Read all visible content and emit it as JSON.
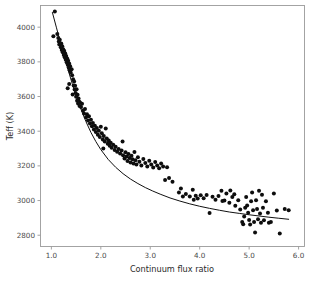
{
  "chart_data": {
    "type": "scatter",
    "title": "",
    "xlabel": "Continuum flux ratio",
    "ylabel": "Teff (K)",
    "xlim": [
      0.78,
      6.12
    ],
    "ylim": [
      2735,
      4125
    ],
    "grid": false,
    "legend": null,
    "xticks": [
      1.0,
      2.0,
      3.0,
      4.0,
      5.0,
      6.0
    ],
    "xticklabels": [
      "1.0",
      "2.0",
      "3.0",
      "4.0",
      "5.0",
      "6.0"
    ],
    "yticks": [
      2800,
      3000,
      3200,
      3400,
      3600,
      3800,
      4000
    ],
    "yticklabels": [
      "2800",
      "3000",
      "3200",
      "3400",
      "3600",
      "3800",
      "4000"
    ],
    "marker": {
      "shape": "circle",
      "color": "#0d0d0d",
      "size": 2.0
    },
    "fit_curve": {
      "name": "empirical calibration fit",
      "color": "#111111",
      "width": 1.0,
      "x": [
        1.02,
        1.1,
        1.18,
        1.26,
        1.34,
        1.42,
        1.5,
        1.6,
        1.7,
        1.8,
        1.9,
        2.0,
        2.15,
        2.3,
        2.45,
        2.6,
        2.75,
        2.9,
        3.05,
        3.2,
        3.4,
        3.6,
        3.8,
        4.0,
        4.2,
        4.4,
        4.6,
        4.8,
        5.0,
        5.2,
        5.4,
        5.6,
        5.8
      ],
      "y": [
        4085,
        4000,
        3915,
        3832,
        3752,
        3676,
        3604,
        3525,
        3455,
        3393,
        3340,
        3294,
        3237,
        3192,
        3155,
        3124,
        3098,
        3075,
        3055,
        3037,
        3015,
        2997,
        2981,
        2967,
        2955,
        2944,
        2934,
        2926,
        2918,
        2911,
        2904,
        2898,
        2892
      ]
    },
    "points": [
      [
        1.07,
        4090
      ],
      [
        1.04,
        3947
      ],
      [
        1.12,
        3960
      ],
      [
        1.14,
        3938
      ],
      [
        1.15,
        3918
      ],
      [
        1.16,
        3900
      ],
      [
        1.17,
        3928
      ],
      [
        1.19,
        3884
      ],
      [
        1.2,
        3906
      ],
      [
        1.21,
        3868
      ],
      [
        1.22,
        3890
      ],
      [
        1.23,
        3855
      ],
      [
        1.24,
        3872
      ],
      [
        1.25,
        3840
      ],
      [
        1.26,
        3862
      ],
      [
        1.27,
        3826
      ],
      [
        1.28,
        3848
      ],
      [
        1.29,
        3812
      ],
      [
        1.3,
        3834
      ],
      [
        1.31,
        3798
      ],
      [
        1.32,
        3820
      ],
      [
        1.33,
        3784
      ],
      [
        1.34,
        3806
      ],
      [
        1.35,
        3768
      ],
      [
        1.36,
        3790
      ],
      [
        1.37,
        3752
      ],
      [
        1.38,
        3775
      ],
      [
        1.39,
        3738
      ],
      [
        1.41,
        3758
      ],
      [
        1.42,
        3722
      ],
      [
        1.33,
        3648
      ],
      [
        1.36,
        3672
      ],
      [
        1.44,
        3700
      ],
      [
        1.45,
        3664
      ],
      [
        1.46,
        3686
      ],
      [
        1.47,
        3640
      ],
      [
        1.48,
        3662
      ],
      [
        1.49,
        3620
      ],
      [
        1.5,
        3598
      ],
      [
        1.51,
        3642
      ],
      [
        1.52,
        3576
      ],
      [
        1.53,
        3610
      ],
      [
        1.54,
        3560
      ],
      [
        1.55,
        3588
      ],
      [
        1.56,
        3572
      ],
      [
        1.57,
        3545
      ],
      [
        1.58,
        3566
      ],
      [
        1.6,
        3540
      ],
      [
        1.62,
        3558
      ],
      [
        1.64,
        3520
      ],
      [
        1.66,
        3502
      ],
      [
        1.68,
        3528
      ],
      [
        1.7,
        3480
      ],
      [
        1.72,
        3498
      ],
      [
        1.74,
        3462
      ],
      [
        1.76,
        3486
      ],
      [
        1.78,
        3444
      ],
      [
        1.8,
        3466
      ],
      [
        1.82,
        3428
      ],
      [
        1.84,
        3448
      ],
      [
        1.86,
        3410
      ],
      [
        1.88,
        3432
      ],
      [
        1.9,
        3396
      ],
      [
        1.92,
        3418
      ],
      [
        1.94,
        3380
      ],
      [
        1.96,
        3402
      ],
      [
        1.98,
        3366
      ],
      [
        2.0,
        3425
      ],
      [
        2.02,
        3388
      ],
      [
        2.04,
        3352
      ],
      [
        2.06,
        3372
      ],
      [
        2.08,
        3340
      ],
      [
        2.1,
        3416
      ],
      [
        2.12,
        3358
      ],
      [
        2.14,
        3328
      ],
      [
        2.16,
        3346
      ],
      [
        2.18,
        3316
      ],
      [
        2.2,
        3334
      ],
      [
        2.22,
        3304
      ],
      [
        2.25,
        3322
      ],
      [
        2.28,
        3292
      ],
      [
        2.3,
        3310
      ],
      [
        2.33,
        3282
      ],
      [
        2.36,
        3298
      ],
      [
        2.39,
        3272
      ],
      [
        2.42,
        3288
      ],
      [
        2.45,
        3262
      ],
      [
        2.48,
        3242
      ],
      [
        2.5,
        3278
      ],
      [
        2.52,
        3254
      ],
      [
        2.54,
        3228
      ],
      [
        2.56,
        3268
      ],
      [
        2.58,
        3246
      ],
      [
        2.6,
        3220
      ],
      [
        2.62,
        3258
      ],
      [
        2.64,
        3238
      ],
      [
        2.66,
        3214
      ],
      [
        2.68,
        3280
      ],
      [
        2.7,
        3232
      ],
      [
        2.72,
        3208
      ],
      [
        2.75,
        3250
      ],
      [
        2.78,
        3224
      ],
      [
        2.82,
        3202
      ],
      [
        2.86,
        3240
      ],
      [
        2.9,
        3216
      ],
      [
        2.94,
        3196
      ],
      [
        2.98,
        3230
      ],
      [
        3.02,
        3208
      ],
      [
        3.06,
        3190
      ],
      [
        3.1,
        3222
      ],
      [
        3.14,
        3202
      ],
      [
        3.18,
        3186
      ],
      [
        3.22,
        3214
      ],
      [
        3.26,
        3196
      ],
      [
        3.3,
        3118
      ],
      [
        3.34,
        3192
      ],
      [
        3.38,
        3130
      ],
      [
        3.45,
        3108
      ],
      [
        3.58,
        3046
      ],
      [
        3.62,
        3070
      ],
      [
        3.72,
        3038
      ],
      [
        3.8,
        3024
      ],
      [
        3.86,
        3062
      ],
      [
        3.92,
        3028
      ],
      [
        3.96,
        3012
      ],
      [
        4.02,
        3030
      ],
      [
        4.08,
        3014
      ],
      [
        4.14,
        3032
      ],
      [
        4.2,
        2928
      ],
      [
        4.26,
        3022
      ],
      [
        4.32,
        3004
      ],
      [
        4.38,
        3026
      ],
      [
        4.44,
        3056
      ],
      [
        4.5,
        3000
      ],
      [
        4.54,
        3040
      ],
      [
        4.6,
        2988
      ],
      [
        4.66,
        3020
      ],
      [
        4.72,
        2970
      ],
      [
        4.78,
        3002
      ],
      [
        4.82,
        2948
      ],
      [
        4.86,
        2876
      ],
      [
        4.88,
        2864
      ],
      [
        4.9,
        2908
      ],
      [
        4.92,
        2958
      ],
      [
        4.94,
        3020
      ],
      [
        4.96,
        2972
      ],
      [
        4.98,
        2930
      ],
      [
        5.0,
        2888
      ],
      [
        5.02,
        2862
      ],
      [
        5.04,
        2996
      ],
      [
        5.06,
        3046
      ],
      [
        5.08,
        2944
      ],
      [
        5.1,
        2876
      ],
      [
        5.12,
        2816
      ],
      [
        5.14,
        3002
      ],
      [
        5.16,
        2952
      ],
      [
        5.18,
        2892
      ],
      [
        5.2,
        3056
      ],
      [
        5.22,
        2926
      ],
      [
        5.24,
        2872
      ],
      [
        5.26,
        3034
      ],
      [
        5.28,
        2958
      ],
      [
        5.3,
        2886
      ],
      [
        5.34,
        2996
      ],
      [
        5.38,
        2930
      ],
      [
        5.44,
        2876
      ],
      [
        5.5,
        3040
      ],
      [
        5.56,
        2942
      ],
      [
        5.62,
        2810
      ],
      [
        5.72,
        2952
      ],
      [
        5.8,
        2944
      ],
      [
        4.62,
        3058
      ],
      [
        4.7,
        3036
      ],
      [
        5.4,
        2872
      ],
      [
        3.66,
        3024
      ],
      [
        3.88,
        3004
      ],
      [
        4.46,
        2998
      ],
      [
        2.44,
        3340
      ],
      [
        2.05,
        3300
      ],
      [
        1.43,
        3612
      ]
    ]
  },
  "axes": {
    "x_axis_title": "Continuum flux ratio",
    "y_axis_title": "Teff (K)"
  }
}
